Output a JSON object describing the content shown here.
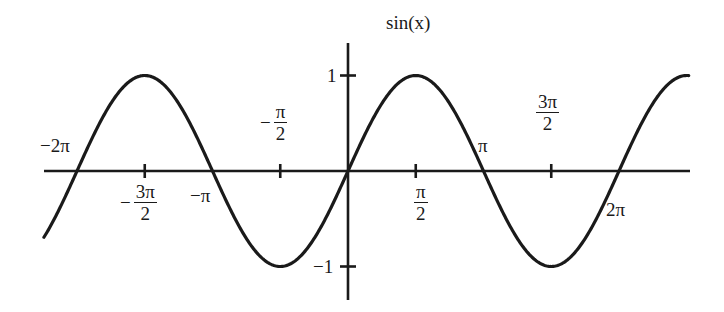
{
  "chart_data": {
    "type": "line",
    "title": "sin(x)",
    "xlabel": "",
    "ylabel": "",
    "function": "sin(x)",
    "xlim": [
      -7.05,
      7.9
    ],
    "ylim": [
      -1.3,
      1.35
    ],
    "grid": false,
    "legend": null,
    "series": [
      {
        "name": "sin(x)",
        "x": [
          -7.05,
          -6.2832,
          -4.7124,
          -3.1416,
          -1.5708,
          0,
          1.5708,
          3.1416,
          4.7124,
          6.2832,
          7.854
        ],
        "y": [
          -0.69,
          0,
          1,
          0,
          -1,
          0,
          1,
          0,
          -1,
          0,
          1
        ]
      }
    ],
    "x_ticks": [
      {
        "value": -4.7124,
        "label_sign": "−",
        "label_num": "3π",
        "label_den": "2"
      },
      {
        "value": -1.5708,
        "label_sign": "−",
        "label_num": "π",
        "label_den": "2"
      },
      {
        "value": 1.5708,
        "label_sign": "",
        "label_num": "π",
        "label_den": "2"
      },
      {
        "value": 4.7124,
        "label_sign": "",
        "label_num": "3π",
        "label_den": "2"
      }
    ],
    "y_ticks": [
      {
        "value": 1,
        "label": "1"
      },
      {
        "value": -1,
        "label": "−1"
      }
    ],
    "annotations": [
      {
        "x": -6.2832,
        "text": "−2π"
      },
      {
        "x": -3.1416,
        "text": "−π"
      },
      {
        "x": 3.1416,
        "text": "π"
      },
      {
        "x": 6.2832,
        "text": "2π"
      }
    ],
    "colors": {
      "curve": "#1a1a1a",
      "axes": "#1a1a1a",
      "background": "#ffffff"
    }
  }
}
